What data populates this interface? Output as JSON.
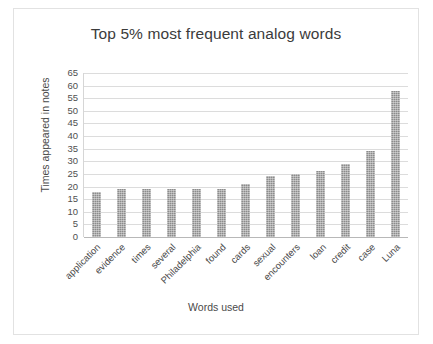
{
  "chart_data": {
    "type": "bar",
    "title": "Top 5% most frequent analog words",
    "xlabel": "Words used",
    "ylabel": "Times appeared in notes",
    "categories": [
      "application",
      "evidence",
      "times",
      "several",
      "Philadelphia",
      "found",
      "cards",
      "sexual",
      "encounters",
      "loan",
      "credit",
      "case",
      "Luna"
    ],
    "values": [
      18,
      19,
      19,
      19,
      19,
      19,
      21,
      24,
      25,
      26,
      29,
      34,
      58
    ],
    "ylim": [
      0,
      65
    ],
    "ytick_step": 5,
    "yticks": [
      "65",
      "60",
      "55",
      "50",
      "45",
      "40",
      "35",
      "30",
      "25",
      "20",
      "15",
      "10",
      "5",
      "0"
    ],
    "grid": true,
    "legend": false,
    "bar_color": "#8c8c8c",
    "gridline_color": "#dcdcdc",
    "text_color": "#4a4a4a"
  }
}
